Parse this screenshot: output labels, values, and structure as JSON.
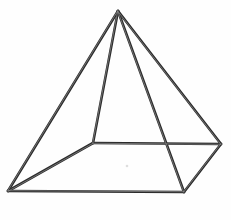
{
  "figure": {
    "shape_name": "square-pyramid",
    "projection": "oblique",
    "background_color": "#fefefe",
    "stroke_color": "#2b2b2b",
    "highlight_color": "#8e8e8e",
    "stroke_width": 2.6,
    "canvas": {
      "width": 231,
      "height": 220
    },
    "counts": {
      "vertices": 5,
      "edges": 8,
      "faces": 5
    }
  },
  "vertices": [
    {
      "id": "apex",
      "label": "apex",
      "x": 118,
      "y": 11
    },
    {
      "id": "base-back-left",
      "label": "base back left",
      "x": 93,
      "y": 143
    },
    {
      "id": "base-back-right",
      "label": "base back right",
      "x": 221,
      "y": 144
    },
    {
      "id": "base-front-right",
      "label": "base front right",
      "x": 184,
      "y": 192
    },
    {
      "id": "base-front-left",
      "label": "base front left",
      "x": 8,
      "y": 191
    }
  ],
  "edges": [
    {
      "id": "edge-apex-front-left",
      "label": "apex to base front left",
      "from": "apex",
      "to": "base-front-left"
    },
    {
      "id": "edge-apex-back-left",
      "label": "apex to base back left",
      "from": "apex",
      "to": "base-back-left"
    },
    {
      "id": "edge-apex-back-right",
      "label": "apex to base back right",
      "from": "apex",
      "to": "base-back-right"
    },
    {
      "id": "edge-apex-front-right",
      "label": "apex to base front right",
      "from": "apex",
      "to": "base-front-right"
    },
    {
      "id": "edge-base-back",
      "label": "base back edge",
      "from": "base-back-left",
      "to": "base-back-right"
    },
    {
      "id": "edge-base-right",
      "label": "base right edge",
      "from": "base-back-right",
      "to": "base-front-right"
    },
    {
      "id": "edge-base-front",
      "label": "base front edge",
      "from": "base-front-right",
      "to": "base-front-left"
    },
    {
      "id": "edge-base-left",
      "label": "base left edge",
      "from": "base-front-left",
      "to": "base-back-left"
    }
  ],
  "marks": [
    {
      "id": "speck-center",
      "label": "paper speck",
      "x": 127,
      "y": 166,
      "r": 1.3
    }
  ]
}
